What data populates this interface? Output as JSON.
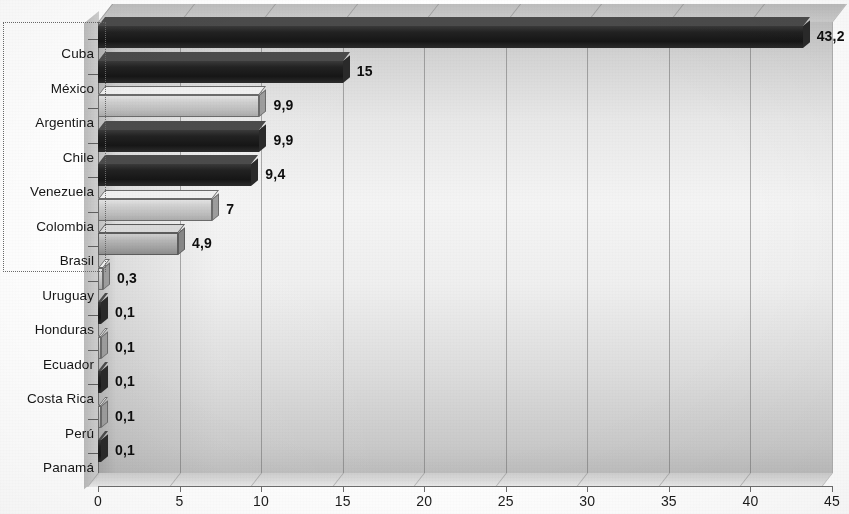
{
  "chart_data": {
    "type": "bar",
    "orientation": "horizontal",
    "title": "",
    "subtitle": "",
    "xlabel": "",
    "ylabel": "",
    "xlim": [
      0,
      45
    ],
    "xticks": [
      "0",
      "5",
      "10",
      "15",
      "20",
      "25",
      "30",
      "35",
      "40",
      "45"
    ],
    "grid": true,
    "legend": null,
    "categories": [
      "Cuba",
      "México",
      "Argentina",
      "Chile",
      "Venezuela",
      "Colombia",
      "Brasil",
      "Uruguay",
      "Honduras",
      "Ecuador",
      "Costa Rica",
      "Perú",
      "Panamá"
    ],
    "values": [
      43.2,
      15,
      9.9,
      9.9,
      9.4,
      7,
      4.9,
      0.3,
      0.1,
      0.1,
      0.1,
      0.1,
      0.1
    ],
    "value_labels": [
      "43,2",
      "15",
      "9,9",
      "9,9",
      "9,4",
      "7",
      "4,9",
      "0,3",
      "0,1",
      "0,1",
      "0,1",
      "0,1",
      "0,1"
    ],
    "bar_styles": [
      "dark",
      "dark",
      "light",
      "dark",
      "dark",
      "light",
      "mid",
      "light",
      "dark",
      "light",
      "dark",
      "light",
      "dark"
    ]
  },
  "colors": {
    "bar_dark": "#1a1a1a",
    "bar_light": "#c6c6c6",
    "bar_mid": "#a8a8a8",
    "plot_background": "#e8e8e8",
    "gridline": "#6e6e6e",
    "text": "#161616"
  },
  "selection": {
    "label": "selection-marquee"
  }
}
